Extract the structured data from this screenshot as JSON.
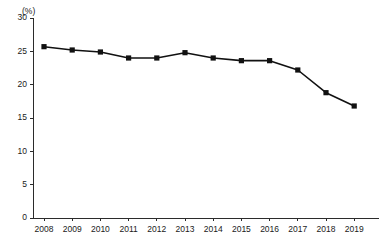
{
  "chart_data": {
    "type": "line",
    "title": "",
    "subtitle": "",
    "xlabel": "",
    "ylabel": "",
    "unit_label": "(%)",
    "categories": [
      "2008",
      "2009",
      "2010",
      "2011",
      "2012",
      "2013",
      "2014",
      "2015",
      "2016",
      "2017",
      "2018",
      "2019"
    ],
    "values": [
      25.7,
      25.2,
      24.9,
      24.0,
      24.0,
      24.8,
      24.0,
      23.6,
      23.6,
      22.2,
      18.8,
      16.8
    ],
    "series": [
      {
        "name": "",
        "values": [
          25.7,
          25.2,
          24.9,
          24.0,
          24.0,
          24.8,
          24.0,
          23.6,
          23.6,
          22.2,
          18.8,
          16.8
        ]
      }
    ],
    "ylim": [
      0,
      30
    ],
    "yticks": [
      0,
      5,
      10,
      15,
      20,
      25,
      30
    ],
    "ytick_labels": [
      "0",
      "5",
      "10",
      "15",
      "20",
      "25",
      "30"
    ],
    "xtick_labels": [
      "2008",
      "2009",
      "2010",
      "2011",
      "2012",
      "2013",
      "2014",
      "2015",
      "2016",
      "2017",
      "2018",
      "2019"
    ],
    "grid": false,
    "legend": false,
    "legend_position": "none",
    "marker": "square",
    "line_color": "#111111",
    "marker_color": "#111111",
    "axis_color": "#2b2b2b",
    "background_color": "#ffffff"
  }
}
